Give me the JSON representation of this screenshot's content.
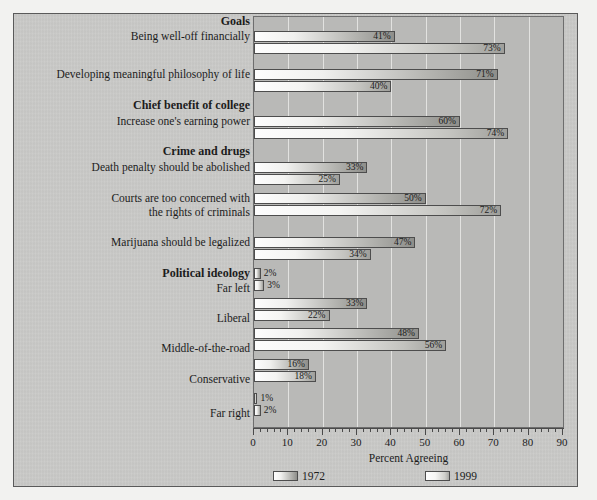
{
  "chart_data": {
    "type": "bar",
    "orientation": "horizontal",
    "title": "",
    "xlabel": "Percent Agreeing",
    "ylabel": "",
    "xlim": [
      0,
      90
    ],
    "xticks": [
      0,
      10,
      20,
      30,
      40,
      50,
      60,
      70,
      80,
      90
    ],
    "minor_tick_step": 2,
    "grid": "vertical",
    "legend": {
      "position": "bottom",
      "entries": [
        {
          "name": "1972",
          "swatch": "gradient-light-to-dark"
        },
        {
          "name": "1999",
          "swatch": "gradient-light-to-dark"
        }
      ]
    },
    "series": [
      {
        "name": "1972",
        "values": [
          41,
          71,
          60,
          33,
          50,
          47,
          2,
          33,
          48,
          16,
          1
        ]
      },
      {
        "name": "1999",
        "values": [
          73,
          40,
          74,
          25,
          72,
          34,
          3,
          22,
          56,
          18,
          2
        ]
      }
    ],
    "categories": [
      "Being well-off financially",
      "Developing meaningful philosophy of life",
      "Increase one's earning power",
      "Death penalty should be abolished",
      "Courts are too concerned with the rights of criminals",
      "Marijuana should be legalized",
      "Far left",
      "Liberal",
      "Middle-of-the-road",
      "Conservative",
      "Far right"
    ],
    "groups": [
      {
        "heading": "Goals",
        "categories": [
          "Being well-off financially",
          "Developing meaningful philosophy of life"
        ]
      },
      {
        "heading": "Chief benefit of college",
        "categories": [
          "Increase one's earning power"
        ]
      },
      {
        "heading": "Crime and drugs",
        "categories": [
          "Death penalty should be abolished",
          "Courts are too concerned with the rights of criminals",
          "Marijuana should be legalized"
        ]
      },
      {
        "heading": "Political ideology",
        "categories": [
          "Far left",
          "Liberal",
          "Middle-of-the-road",
          "Conservative",
          "Far right"
        ]
      }
    ],
    "value_labels": [
      "41%",
      "73%",
      "71%",
      "40%",
      "60%",
      "74%",
      "33%",
      "25%",
      "50%",
      "72%",
      "47%",
      "34%",
      "2%",
      "3%",
      "33%",
      "22%",
      "48%",
      "56%",
      "16%",
      "18%",
      "1%",
      "2%"
    ],
    "colors": {
      "plot_background": "#b9b9b7",
      "figure_background": "#c8c8c6",
      "bar_outline": "#4d4d4d",
      "gridline": "#f0f0ee",
      "text": "#1c1c1c"
    }
  },
  "labels": {
    "group_goals": "Goals",
    "cat_financial": "Being well-off financially",
    "cat_philosophy": "Developing meaningful philosophy of life",
    "group_college": "Chief benefit of college",
    "cat_earning": "Increase one's earning power",
    "group_crime": "Crime and drugs",
    "cat_death_penalty": "Death penalty should be abolished",
    "cat_courts_line1": "Courts are too concerned with",
    "cat_courts_line2": "the rights of criminals",
    "cat_marijuana": "Marijuana should be legalized",
    "group_ideology": "Political ideology",
    "cat_far_left": "Far left",
    "cat_liberal": "Liberal",
    "cat_middle": "Middle-of-the-road",
    "cat_conservative": "Conservative",
    "cat_far_right": "Far right"
  },
  "axis": {
    "xlabel": "Percent Agreeing",
    "ticks": [
      "0",
      "10",
      "20",
      "30",
      "40",
      "50",
      "60",
      "70",
      "80",
      "90"
    ]
  },
  "legend": {
    "item1": "1972",
    "item2": "1999"
  }
}
